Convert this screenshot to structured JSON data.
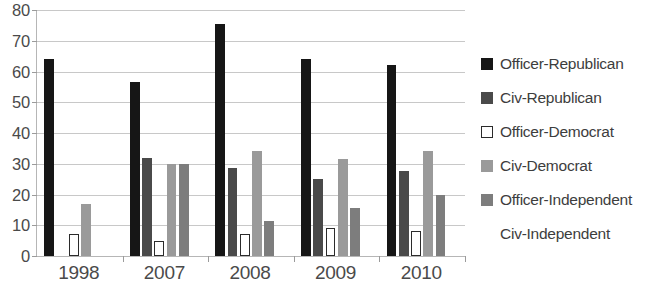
{
  "chart_data": {
    "type": "bar",
    "title": "",
    "subtitle": "",
    "xlabel": "",
    "ylabel": "",
    "ylim": [
      0,
      80
    ],
    "ytick_step": 10,
    "yticks": [
      "0",
      "10",
      "20",
      "30",
      "40",
      "50",
      "60",
      "70",
      "80"
    ],
    "grid": true,
    "legend_position": "right",
    "categories": [
      "1998",
      "2007",
      "2008",
      "2009",
      "2010"
    ],
    "series": [
      {
        "name": "Officer-Republican",
        "color": "#161616",
        "border": "#161616",
        "values": [
          64,
          56.5,
          75.5,
          64,
          62
        ]
      },
      {
        "name": "Civ-Republican",
        "color": "#4a4a4a",
        "border": "#4a4a4a",
        "values": [
          null,
          32,
          28.5,
          25,
          27.5
        ]
      },
      {
        "name": "Officer-Democrat",
        "color": "#ffffff",
        "border": "#2b2b2b",
        "values": [
          7,
          5,
          7,
          9,
          8
        ]
      },
      {
        "name": "Civ-Democrat",
        "color": "#9a9a9a",
        "border": "#9a9a9a",
        "values": [
          17,
          30,
          34,
          31.5,
          34
        ]
      },
      {
        "name": "Officer-Independent",
        "color": "#7d7d7d",
        "border": "#7d7d7d",
        "values": [
          null,
          30,
          11.5,
          15.5,
          20
        ]
      },
      {
        "name": "Civ-Independent",
        "color": "#ffffff",
        "border": "#ffffff",
        "values": [
          null,
          null,
          null,
          null,
          null
        ]
      }
    ]
  },
  "legend": {
    "items": [
      {
        "label": "Officer-Republican",
        "color": "#161616",
        "border": "#161616"
      },
      {
        "label": "Civ-Republican",
        "color": "#4a4a4a",
        "border": "#4a4a4a"
      },
      {
        "label": "Officer-Democrat",
        "color": "#ffffff",
        "border": "#2b2b2b"
      },
      {
        "label": "Civ-Democrat",
        "color": "#9a9a9a",
        "border": "#9a9a9a"
      },
      {
        "label": "Officer-Independent",
        "color": "#7d7d7d",
        "border": "#7d7d7d"
      },
      {
        "label": "Civ-Independent",
        "color": "#ffffff",
        "border": "#ffffff"
      }
    ]
  }
}
